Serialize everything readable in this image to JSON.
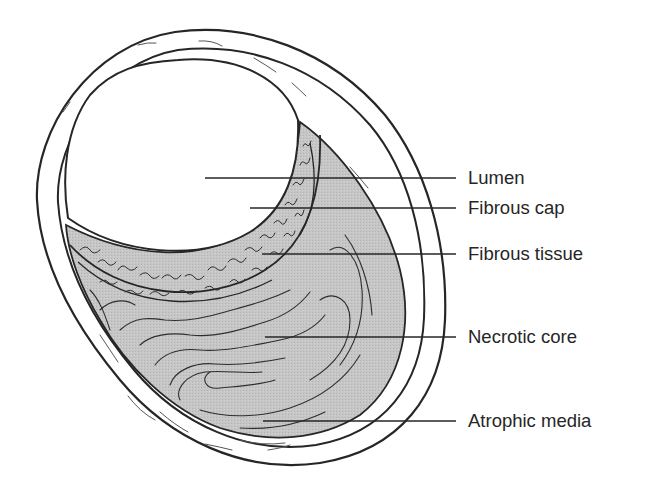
{
  "figure": {
    "colors": {
      "line": "#262626",
      "plaque_fill": "#c4c4c4",
      "background": "#ffffff",
      "texture": "#3a3a3a"
    }
  },
  "labels": [
    {
      "id": "lumen",
      "text": "Lumen",
      "y": 178
    },
    {
      "id": "fibrous-cap",
      "text": "Fibrous cap",
      "y": 208
    },
    {
      "id": "fibrous-tissue",
      "text": "Fibrous tissue",
      "y": 254
    },
    {
      "id": "necrotic-core",
      "text": "Necrotic core",
      "y": 337
    },
    {
      "id": "atrophic-media",
      "text": "Atrophic media",
      "y": 421
    }
  ]
}
